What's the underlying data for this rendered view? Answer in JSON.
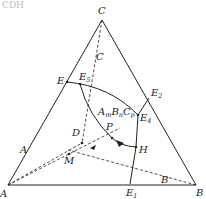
{
  "header_text": "CDH",
  "diagram": {
    "type": "ternary-phase-diagram",
    "vertices": {
      "A": "A",
      "B": "B",
      "C": "C"
    },
    "edge_labels": {
      "a_side": "A",
      "b_side": "B",
      "c_side": "C"
    },
    "points": {
      "E": "E",
      "E5": {
        "base": "E",
        "sub": "5"
      },
      "E2": {
        "base": "E",
        "sub": "2"
      },
      "E4": {
        "base": "E",
        "sub": "4"
      },
      "E1": {
        "base": "E",
        "sub": "1"
      },
      "H": "H",
      "P": "P",
      "D": "D",
      "M": "M"
    },
    "compound": {
      "A": "A",
      "m": "m",
      "B": "B",
      "n": "n",
      "C": "C",
      "p": "p"
    },
    "colors": {
      "line": "#222222",
      "background": "#ffffff"
    }
  }
}
